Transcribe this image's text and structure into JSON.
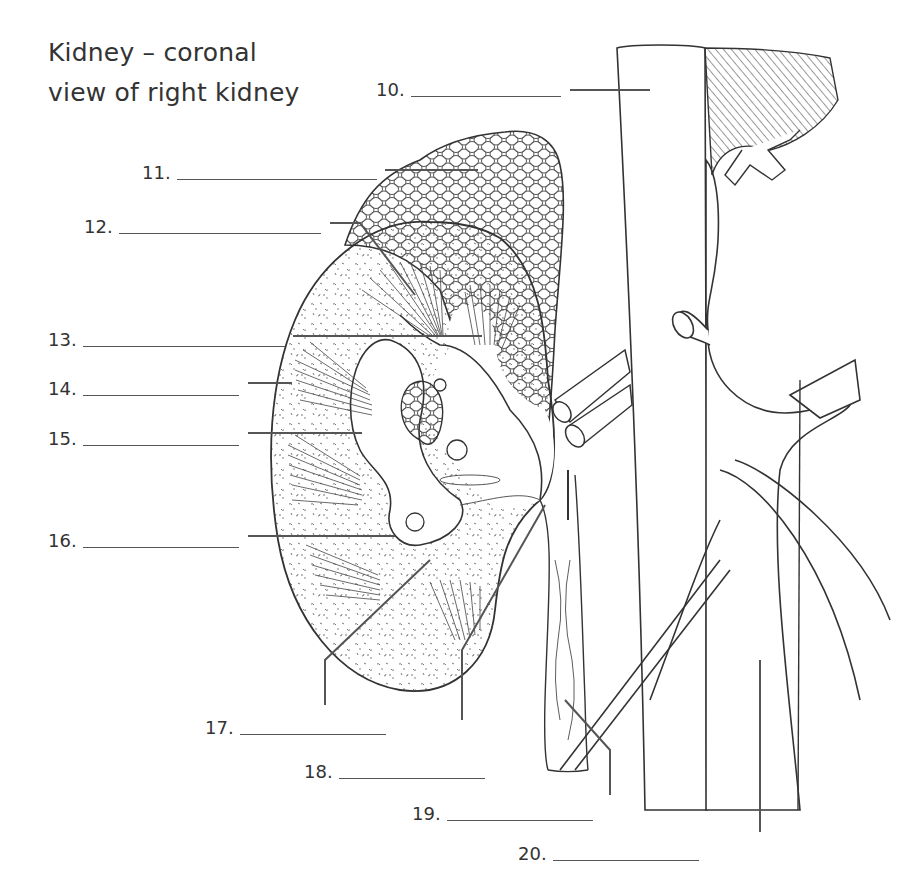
{
  "title": {
    "line1": "Kidney – coronal",
    "line2": "view of right kidney"
  },
  "labels": [
    {
      "number": "10.",
      "answer": ""
    },
    {
      "number": "11.",
      "answer": ""
    },
    {
      "number": "12.",
      "answer": ""
    },
    {
      "number": "13.",
      "answer": ""
    },
    {
      "number": "14.",
      "answer": ""
    },
    {
      "number": "15.",
      "answer": ""
    },
    {
      "number": "16.",
      "answer": ""
    },
    {
      "number": "17.",
      "answer": ""
    },
    {
      "number": "18.",
      "answer": ""
    },
    {
      "number": "19.",
      "answer": ""
    },
    {
      "number": "20.",
      "answer": ""
    }
  ],
  "illustration": {
    "subject": "kidney-coronal-section",
    "structures_drawn": [
      "adrenal-gland",
      "kidney",
      "renal-pyramids",
      "renal-pelvis",
      "ureter",
      "aorta",
      "inferior-vena-cava",
      "renal-vessels",
      "diaphragm"
    ]
  },
  "colors": {
    "line": "#333333",
    "leader": "#555555",
    "background": "#ffffff"
  }
}
